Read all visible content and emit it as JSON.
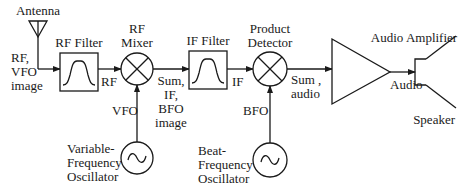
{
  "diagram": {
    "colors": {
      "line": "#1a1a1a",
      "background": "#ffffff"
    },
    "blocks": {
      "antenna": {
        "label": "Antenna"
      },
      "rf_filter": {
        "label": "RF Filter"
      },
      "rf_mixer": {
        "label_line1": "RF",
        "label_line2": "Mixer"
      },
      "if_filter": {
        "label": "IF Filter"
      },
      "product_detector": {
        "label_line1": "Product",
        "label_line2": "Detector"
      },
      "audio_amplifier": {
        "label": "Audio Amplifier"
      },
      "speaker": {
        "label": "Speaker"
      },
      "vfo": {
        "label_line1": "Variable-",
        "label_line2": "Frequency",
        "label_line3": "Oscillator"
      },
      "bfo": {
        "label_line1": "Beat-",
        "label_line2": "Frequency",
        "label_line3": "Oscillator"
      }
    },
    "signals": {
      "antenna_out": {
        "line1": "RF,",
        "line2": "VFO",
        "line3": "image"
      },
      "rf_filter_out": "RF",
      "mixer_out": {
        "line1": "Sum,",
        "line2": "IF,",
        "line3": "BFO",
        "line4": "image"
      },
      "if_filter_out": "IF",
      "detector_out": {
        "line1": "Sum ,",
        "line2": "audio"
      },
      "amp_out": "Audio",
      "vfo_out": "VFO",
      "bfo_out": "BFO"
    }
  }
}
